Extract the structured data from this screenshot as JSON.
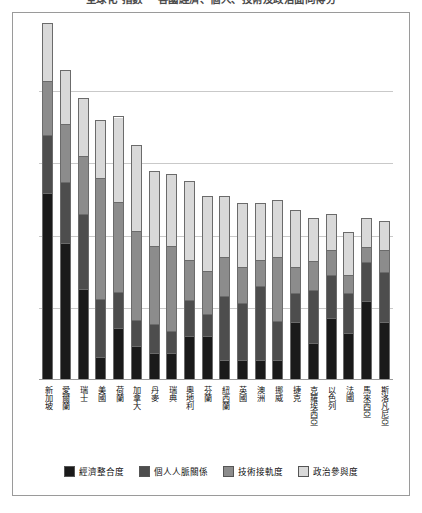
{
  "title": "全球化 指數 ─ 各國經濟、個人、技術及政治面向得分",
  "legend": {
    "position": "bottom",
    "items": [
      {
        "label": "經濟整合度",
        "color": "#1a1a1a",
        "key": "economic"
      },
      {
        "label": "個人人脈關係",
        "color": "#4d4d4d",
        "key": "personal"
      },
      {
        "label": "技術接軌度",
        "color": "#8c8c8c",
        "key": "technology"
      },
      {
        "label": "政治參與度",
        "color": "#d9d9d9",
        "key": "political"
      }
    ]
  },
  "chart_data": {
    "type": "bar",
    "stacked": true,
    "orientation": "vertical",
    "title": "全球化 指數 ─ 各國經濟、個人、技術及政治面向得分",
    "xlabel": "",
    "ylabel": "",
    "ylim": [
      0,
      100
    ],
    "grid": true,
    "gridline_values": [
      20,
      40,
      60,
      80
    ],
    "categories": [
      "新加坡",
      "愛爾蘭",
      "瑞士",
      "美國",
      "荷蘭",
      "加拿大",
      "丹麥",
      "瑞典",
      "奧地利",
      "芬蘭",
      "紐西蘭",
      "英國",
      "澳洲",
      "挪威",
      "捷克",
      "克羅埃西亞",
      "以色列",
      "法國",
      "馬來西亞",
      "斯洛凡尼亞"
    ],
    "series": [
      {
        "name": "經濟整合度",
        "color": "#1a1a1a",
        "values": [
          52,
          38,
          25,
          6,
          14,
          9,
          7,
          7,
          12,
          12,
          5,
          5,
          5,
          5,
          16,
          10,
          17,
          13,
          22,
          16
        ]
      },
      {
        "name": "個人人脈關係",
        "color": "#4d4d4d",
        "values": [
          16,
          17,
          21,
          16,
          10,
          7,
          8,
          6,
          10,
          6,
          18,
          16,
          21,
          11,
          8,
          15,
          12,
          11,
          11,
          14
        ]
      },
      {
        "name": "技術接軌度",
        "color": "#8c8c8c",
        "values": [
          15,
          16,
          16,
          34,
          25,
          25,
          22,
          24,
          11,
          12,
          11,
          10,
          7,
          18,
          7,
          8,
          7,
          5,
          4,
          6
        ]
      },
      {
        "name": "政治參與度",
        "color": "#d9d9d9",
        "values": [
          16,
          15,
          16,
          16,
          24,
          24,
          21,
          20,
          22,
          21,
          17,
          18,
          16,
          16,
          16,
          12,
          10,
          12,
          8,
          8
        ]
      }
    ],
    "totals": [
      99,
      86,
      78,
      72,
      73,
      65,
      58,
      57,
      55,
      51,
      51,
      49,
      49,
      50,
      47,
      45,
      46,
      41,
      45,
      44
    ]
  }
}
